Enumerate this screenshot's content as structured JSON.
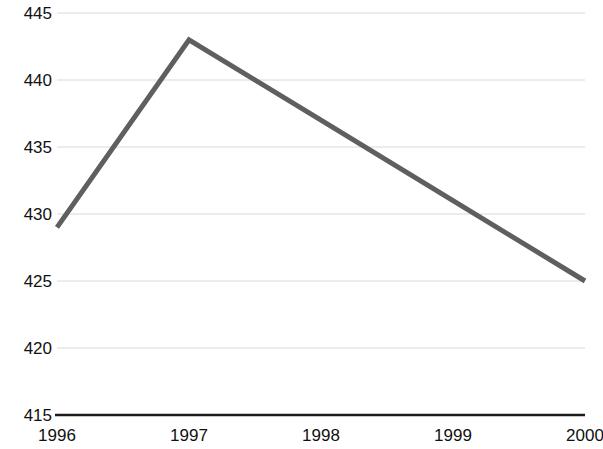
{
  "chart_data": {
    "type": "line",
    "title": "",
    "subtitle": "",
    "xlabel": "",
    "ylabel": "",
    "categories": [
      "1996",
      "1997",
      "1998",
      "1999",
      "2000"
    ],
    "values": [
      429,
      443,
      437,
      431,
      425
    ],
    "series": [
      {
        "name": "",
        "values": [
          429,
          443,
          437,
          431,
          425
        ]
      }
    ],
    "ylim": [
      415,
      445
    ],
    "y_ticks": [
      415,
      420,
      425,
      430,
      435,
      440,
      445
    ],
    "y_tick_labels": [
      "415",
      "420",
      "425",
      "430",
      "435",
      "440",
      "445"
    ],
    "x_tick_labels": [
      "1996",
      "1997",
      "1998",
      "1999",
      "2000"
    ],
    "grid": true,
    "grid_axis": "y",
    "legend": false,
    "legend_position": "none",
    "annotations": [],
    "colors": {
      "line": "#5f5f5f",
      "grid": "#d8d8d8",
      "axis": "#1a1a1a",
      "text": "#111111",
      "background": "#ffffff"
    },
    "line_width": 5
  },
  "axis": {
    "y_labels": [
      "445",
      "440",
      "435",
      "430",
      "425",
      "420",
      "415"
    ],
    "x_labels": [
      "1996",
      "1997",
      "1998",
      "1999",
      "2000"
    ]
  }
}
